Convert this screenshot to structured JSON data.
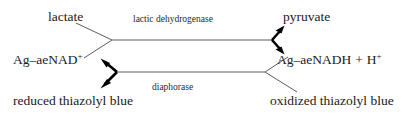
{
  "diagram": {
    "background_color": "#ffffff",
    "line_color": "#4a4a4a",
    "arrow_color": "#000000",
    "text_color": "#1a1a1a",
    "top_reaction": {
      "substrate_label": "lactate",
      "product_label": "pyruvate",
      "enzyme_label": "lactic dehydrogenase",
      "cofactor_in_label_base": "Ag–aeNAD",
      "cofactor_in_label_sup": "+",
      "cofactor_out_label_base": "Ag–aeNADH",
      "cofactor_out_plus": "+",
      "cofactor_out_proton": "H",
      "cofactor_out_proton_sup": "+"
    },
    "bottom_reaction": {
      "enzyme_label": "diaphorase",
      "substrate_label": "oxidized thiazolyl blue",
      "product_label": "reduced thiazolyl blue"
    }
  }
}
